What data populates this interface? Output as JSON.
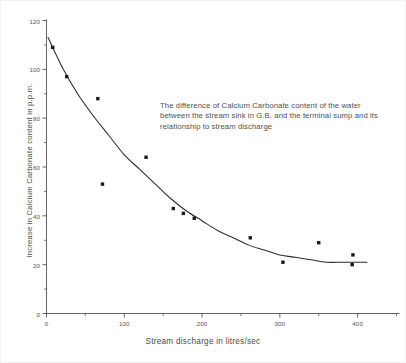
{
  "chart_data": {
    "type": "scatter",
    "title": "",
    "annotation": "The difference of Calcium Carbonate content of the water between the stream sink in G.B. and the terminal sump and its relationship to stream discharge",
    "xlabel": "Stream discharge in litres/sec",
    "ylabel": "Increase in Calcium Carbonate content in p.p.m.",
    "xlim": [
      0,
      450
    ],
    "ylim": [
      0,
      120
    ],
    "xticks": [
      0,
      100,
      200,
      300,
      400
    ],
    "xticklabels": [
      "0",
      "100",
      "200",
      "300",
      "400"
    ],
    "xminorticks": [
      50,
      150,
      250,
      350,
      450
    ],
    "yticks": [
      0,
      20,
      40,
      60,
      80,
      100,
      120
    ],
    "yticklabels": [
      "0",
      "20",
      "40",
      "60",
      "80",
      "100",
      "120"
    ],
    "yminorticks": [
      10,
      30,
      50,
      70,
      90,
      110
    ],
    "grid": false,
    "legend": false,
    "series": [
      {
        "name": "Observations",
        "marker": "square",
        "color": "#1a1a1a",
        "points": [
          {
            "x": 8,
            "y": 109
          },
          {
            "x": 26,
            "y": 97
          },
          {
            "x": 66,
            "y": 88
          },
          {
            "x": 128,
            "y": 64
          },
          {
            "x": 72,
            "y": 53
          },
          {
            "x": 163,
            "y": 43
          },
          {
            "x": 176,
            "y": 41
          },
          {
            "x": 190,
            "y": 39
          },
          {
            "x": 262,
            "y": 31
          },
          {
            "x": 350,
            "y": 29
          },
          {
            "x": 394,
            "y": 24
          },
          {
            "x": 393,
            "y": 20
          },
          {
            "x": 304,
            "y": 21
          }
        ]
      }
    ],
    "fitted_curve": {
      "name": "Fitted trend",
      "color": "#2b2b2b",
      "points": [
        {
          "x": 2,
          "y": 113
        },
        {
          "x": 20,
          "y": 101
        },
        {
          "x": 40,
          "y": 90
        },
        {
          "x": 60,
          "y": 81
        },
        {
          "x": 80,
          "y": 73
        },
        {
          "x": 100,
          "y": 65
        },
        {
          "x": 120,
          "y": 59
        },
        {
          "x": 140,
          "y": 53
        },
        {
          "x": 160,
          "y": 47
        },
        {
          "x": 180,
          "y": 42
        },
        {
          "x": 200,
          "y": 38
        },
        {
          "x": 220,
          "y": 34
        },
        {
          "x": 240,
          "y": 31
        },
        {
          "x": 260,
          "y": 28
        },
        {
          "x": 280,
          "y": 26
        },
        {
          "x": 300,
          "y": 24
        },
        {
          "x": 320,
          "y": 23
        },
        {
          "x": 340,
          "y": 22
        },
        {
          "x": 360,
          "y": 21
        },
        {
          "x": 380,
          "y": 21
        },
        {
          "x": 400,
          "y": 21
        },
        {
          "x": 412,
          "y": 21
        }
      ]
    },
    "colors": {
      "axis": "#555555",
      "marker": "#1a1a1a",
      "curve": "#2b2b2b",
      "text": "#4a4a4a",
      "background": "#ffffff"
    }
  }
}
